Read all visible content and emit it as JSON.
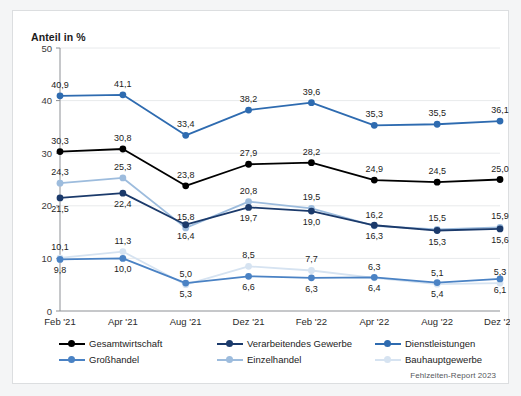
{
  "figure": {
    "axis_title": "Anteil in %",
    "credit": "Fehlzeiten-Report 2023",
    "background": "#ffffff",
    "page_background": "#f4f5f6",
    "border_color": "#dcdee0"
  },
  "legend": {
    "position": "below-axes",
    "items": [
      {
        "label": "Gesamtwirtschaft",
        "color": "#000000"
      },
      {
        "label": "Verarbeitendes Gewerbe",
        "color": "#1b3a6b"
      },
      {
        "label": "Dienstleistungen",
        "color": "#2e6bb0"
      },
      {
        "label": "Großhandel",
        "color": "#4a82c4"
      },
      {
        "label": "Einzelhandel",
        "color": "#9dbcdd"
      },
      {
        "label": "Bauhauptgewerbe",
        "color": "#d6e3f1"
      }
    ]
  },
  "chart_data": {
    "type": "line",
    "title": "",
    "subtitle": "",
    "xlabel": "",
    "ylabel": "Anteil in %",
    "ylim": [
      0,
      50
    ],
    "yticks": [
      0,
      10,
      20,
      30,
      40,
      50
    ],
    "ytick_labels": [
      "0",
      "10",
      "20",
      "30",
      "40",
      "50"
    ],
    "grid": true,
    "grid_axis": "y",
    "legend_position": "bottom",
    "categories": [
      "Feb '21",
      "Apr '21",
      "Aug '21",
      "Dez '21",
      "Feb '22",
      "Apr '22",
      "Aug '22",
      "Dez '22"
    ],
    "series": [
      {
        "name": "Gesamtwirtschaft",
        "color": "#000000",
        "values": [
          30.3,
          30.8,
          23.8,
          27.9,
          28.2,
          24.9,
          24.5,
          25.0
        ],
        "labels": [
          "30,3",
          "30,8",
          "23,8",
          "27,9",
          "28,2",
          "24,9",
          "24,5",
          "25,0"
        ],
        "label_side": [
          "above",
          "above",
          "above",
          "above",
          "above",
          "above",
          "above",
          "above"
        ]
      },
      {
        "name": "Verarbeitendes Gewerbe",
        "color": "#1b3a6b",
        "values": [
          21.5,
          22.4,
          16.4,
          19.7,
          19.0,
          16.3,
          15.3,
          15.6
        ],
        "labels": [
          "21,5",
          "22,4",
          "16,4",
          "19,7",
          "19,0",
          "16,3",
          "15,3",
          "15,6"
        ],
        "label_side": [
          "below",
          "below",
          "below",
          "below",
          "below",
          "below",
          "below",
          "below"
        ]
      },
      {
        "name": "Dienstleistungen",
        "color": "#2e6bb0",
        "values": [
          40.9,
          41.1,
          33.4,
          38.2,
          39.6,
          35.3,
          35.5,
          36.1
        ],
        "labels": [
          "40,9",
          "41,1",
          "33,4",
          "38,2",
          "39,6",
          "35,3",
          "35,5",
          "36,1"
        ],
        "label_side": [
          "above",
          "above",
          "above",
          "above",
          "above",
          "above",
          "above",
          "above"
        ]
      },
      {
        "name": "Großhandel",
        "color": "#4a82c4",
        "values": [
          9.8,
          10.0,
          5.3,
          6.6,
          6.3,
          6.4,
          5.4,
          6.1
        ],
        "labels": [
          "9,8",
          "10,0",
          "5,3",
          "6,6",
          "6,3",
          "6,4",
          "5,4",
          "6,1"
        ],
        "label_side": [
          "below",
          "below",
          "below",
          "below",
          "below",
          "below",
          "below",
          "below"
        ]
      },
      {
        "name": "Einzelhandel",
        "color": "#9dbcdd",
        "values": [
          24.3,
          25.3,
          15.8,
          20.8,
          19.5,
          16.2,
          15.5,
          15.9
        ],
        "labels": [
          "24,3",
          "25,3",
          "15,8",
          "20,8",
          "19,5",
          "16,2",
          "15,5",
          "15,9"
        ],
        "label_side": [
          "above",
          "above",
          "above",
          "above",
          "above",
          "above",
          "above",
          "above"
        ]
      },
      {
        "name": "Bauhauptgewerbe",
        "color": "#d6e3f1",
        "values": [
          10.1,
          11.3,
          5.0,
          8.5,
          7.7,
          6.3,
          5.1,
          5.3
        ],
        "labels": [
          "10,1",
          "11,3",
          "5,0",
          "8,5",
          "7,7",
          "6,3",
          "5,1",
          "5,3"
        ],
        "label_side": [
          "above",
          "above",
          "above",
          "above",
          "above",
          "above",
          "above",
          "above"
        ]
      }
    ]
  }
}
